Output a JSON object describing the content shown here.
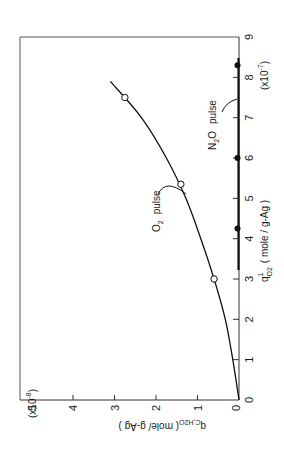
{
  "chart_data": {
    "type": "line",
    "title": "",
    "orientation": "figure printed rotated 90° clockwise",
    "xlabel": "q¹_O2 (mole/g-Ag)",
    "xlabel_parts": {
      "main": "q",
      "sup": "1",
      "sub": "O2",
      "unit": "( mole / g-Ag )"
    },
    "x_scale_label": "(x10⁻⁷)",
    "x_scale_parts": {
      "base": "(x10",
      "exp": "-7",
      "close": ")"
    },
    "ylabel": "q_C,H2O (mole/g-Ag)",
    "ylabel_parts": {
      "main": "q",
      "sub": "C,H2O",
      "unit": "( mole/ g-Ag )"
    },
    "y_scale_label": "(x10⁻⁸)",
    "y_scale_parts": {
      "base": "(x10",
      "exp": "-8",
      "close": ")"
    },
    "xlim": [
      0,
      9
    ],
    "ylim": [
      0,
      5.2
    ],
    "x_ticks": [
      "0",
      "1",
      "2",
      "3",
      "4",
      "5",
      "6",
      "7",
      "8",
      "9"
    ],
    "y_ticks": [
      "0",
      "1",
      "2",
      "3",
      "4",
      "5"
    ],
    "grid": false,
    "series": [
      {
        "name": "O2 pulse (open circles)",
        "marker": "open-circle",
        "x": [
          3.0,
          5.35,
          7.5
        ],
        "y": [
          0.6,
          1.4,
          2.75
        ]
      },
      {
        "name": "N2O pulse (filled circles)",
        "marker": "filled-circle",
        "x": [
          4.25,
          6.0,
          8.3
        ],
        "y": [
          0,
          0,
          0
        ]
      },
      {
        "name": "fitted curve",
        "marker": "none",
        "x": [
          0,
          1,
          2,
          3,
          4,
          5,
          6,
          7,
          7.9
        ],
        "y": [
          0,
          0.15,
          0.33,
          0.6,
          0.92,
          1.28,
          1.75,
          2.35,
          3.1
        ]
      }
    ],
    "annotations": [
      {
        "text": "O₂  pulse",
        "parts": {
          "main": "O",
          "sub": "2",
          "word": "pulse"
        },
        "points_to": "curve near x≈4.9"
      },
      {
        "text": "N₂O  pulse",
        "parts": {
          "main": "N",
          "sub": "2",
          "rest": "O",
          "word": "pulse"
        },
        "points_to": "x-axis near x≈7.3"
      }
    ],
    "legend": null
  }
}
